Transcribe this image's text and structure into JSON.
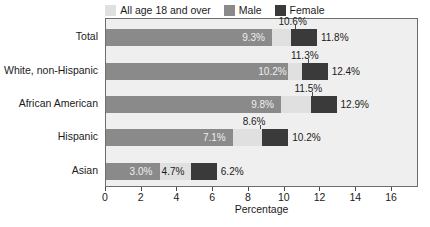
{
  "chart_data": {
    "type": "bar",
    "orientation": "horizontal",
    "title": "",
    "xlabel": "Percentage",
    "ylabel": "",
    "xlim": [
      0,
      17.4
    ],
    "xticks": [
      0,
      2,
      4,
      6,
      8,
      10,
      12,
      14,
      16
    ],
    "grid": false,
    "legend_position": "top-center",
    "categories": [
      "Total",
      "White, non-Hispanic",
      "African American",
      "Hispanic",
      "Asian"
    ],
    "series": [
      {
        "name": "All age 18 and over",
        "color": "#e0e0e0",
        "values": [
          10.6,
          11.3,
          11.5,
          8.6,
          4.7
        ],
        "labels": [
          "10.6%",
          "11.3%",
          "11.5%",
          "8.6%",
          "4.7%"
        ]
      },
      {
        "name": "Male",
        "color": "#8a8a8a",
        "values": [
          9.3,
          10.2,
          9.8,
          7.1,
          3.0
        ],
        "labels": [
          "9.3%",
          "10.2%",
          "9.8%",
          "7.1%",
          "3.0%"
        ]
      },
      {
        "name": "Female",
        "color": "#3a3a3a",
        "values": [
          11.8,
          12.4,
          12.9,
          10.2,
          6.2
        ],
        "labels": [
          "11.8%",
          "12.4%",
          "12.9%",
          "10.2%",
          "6.2%"
        ]
      }
    ]
  },
  "legend": {
    "items": [
      {
        "label": "All age 18 and over",
        "color": "#e0e0e0"
      },
      {
        "label": "Male",
        "color": "#8a8a8a"
      },
      {
        "label": "Female",
        "color": "#3a3a3a"
      }
    ]
  },
  "axis": {
    "x_title": "Percentage",
    "tick_labels": [
      "0",
      "2",
      "4",
      "6",
      "8",
      "10",
      "12",
      "14",
      "16"
    ]
  }
}
